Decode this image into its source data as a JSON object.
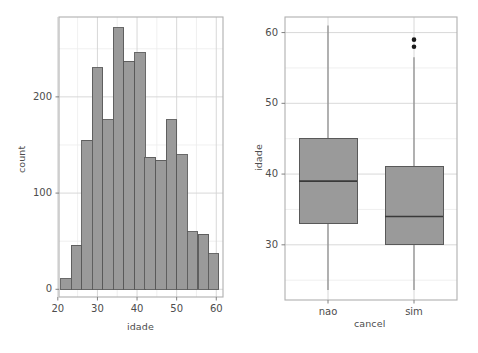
{
  "figure": {
    "background": "#ffffff",
    "panel_border_color": "#808080",
    "grid_major_color": "#d4d4d4",
    "grid_minor_color": "#ececec",
    "text_color": "#4d4d4d",
    "fill_color": "#9a9a9a",
    "stroke_color": "#595959",
    "point_color": "#1a1a1a"
  },
  "chart_data": [
    {
      "type": "bar",
      "name": "histogram-idade",
      "title": "",
      "xlabel": "idade",
      "ylabel": "count",
      "xlim": [
        20.3,
        61.7
      ],
      "ylim": [
        -8,
        283
      ],
      "xticks": [
        20,
        30,
        40,
        50,
        60
      ],
      "xtick_labels": [
        "20",
        "30",
        "40",
        "50",
        "60"
      ],
      "yticks": [
        0,
        100,
        200
      ],
      "ytick_labels": [
        "0",
        "100",
        "200"
      ],
      "yticks_minor": [
        50,
        150,
        250
      ],
      "xticks_minor": [
        25,
        35,
        45,
        55
      ],
      "grid": true,
      "legend": "none",
      "bin_width": 2.67,
      "bin_starts": [
        20.7,
        23.4,
        26.0,
        28.7,
        31.4,
        34.0,
        36.7,
        39.4,
        42.0,
        44.7,
        47.4,
        50.0,
        52.7,
        55.4,
        58.0
      ],
      "bin_centers": [
        22.0,
        24.7,
        27.4,
        30.0,
        32.7,
        35.4,
        38.0,
        40.7,
        43.4,
        46.0,
        48.7,
        51.4,
        54.0,
        56.7,
        59.4
      ],
      "categories": [
        "22.0",
        "24.7",
        "27.4",
        "30.0",
        "32.7",
        "35.4",
        "38.0",
        "40.7",
        "43.4",
        "46.0",
        "48.7",
        "51.4",
        "54.0",
        "56.7",
        "59.4"
      ],
      "values": [
        11,
        46,
        155,
        230,
        176,
        272,
        237,
        246,
        137,
        134,
        176,
        140,
        60,
        57,
        37,
        12
      ]
    },
    {
      "type": "boxplot",
      "name": "boxplot-idade-por-cancel",
      "title": "",
      "xlabel": "cancel",
      "ylabel": "idade",
      "ylim": [
        22.2,
        62.2
      ],
      "yticks": [
        30,
        40,
        50,
        60
      ],
      "ytick_labels": [
        "30",
        "40",
        "50",
        "60"
      ],
      "yticks_minor": [
        25,
        35,
        45,
        55
      ],
      "grid": true,
      "legend": "none",
      "categories": [
        "nao",
        "sim"
      ],
      "boxes": [
        {
          "label": "nao",
          "whisker_low": 23.6,
          "q1": 33.0,
          "median": 39.0,
          "q3": 45.0,
          "whisker_high": 61.0,
          "outliers": []
        },
        {
          "label": "sim",
          "whisker_low": 23.6,
          "q1": 30.0,
          "median": 34.0,
          "q3": 41.0,
          "whisker_high": 56.5,
          "outliers": [
            59.0,
            58.0
          ]
        }
      ]
    }
  ],
  "hist_panel": {
    "axis_x_title": "idade",
    "axis_y_title": "count",
    "xtick_labels": [
      "20",
      "30",
      "40",
      "50",
      "60"
    ],
    "ytick_labels": [
      "200",
      "100",
      "0"
    ]
  },
  "box_panel": {
    "axis_x_title": "cancel",
    "axis_y_title": "idade",
    "xtick_labels": [
      "nao",
      "sim"
    ],
    "ytick_labels": [
      "60",
      "50",
      "40",
      "30"
    ]
  }
}
